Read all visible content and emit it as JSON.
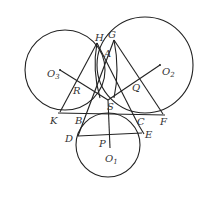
{
  "diagram": {
    "type": "geometry-three-circles",
    "stroke_color": "#222222",
    "circles": [
      {
        "name": "O3",
        "cx": 65,
        "cy": 70,
        "r": 40
      },
      {
        "name": "O2",
        "cx": 145,
        "cy": 65,
        "r": 48
      },
      {
        "name": "O1",
        "cx": 108,
        "cy": 145,
        "r": 32
      }
    ],
    "labels": {
      "H": "H",
      "G": "G",
      "A": "A",
      "O3_main": "O",
      "O3_sub": "3",
      "O2_main": "O",
      "O2_sub": "2",
      "O1_main": "O",
      "O1_sub": "1",
      "R": "R",
      "Q": "Q",
      "S": "S",
      "K": "K",
      "B": "B",
      "C": "C",
      "F": "F",
      "D": "D",
      "E": "E",
      "P": "P"
    }
  }
}
